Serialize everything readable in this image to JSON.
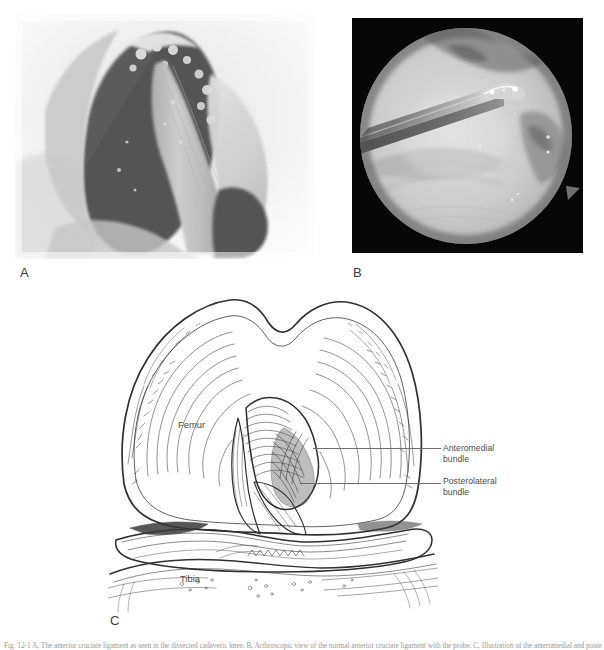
{
  "figure": {
    "background_color": "#ffffff",
    "caption_text": "Fig. 12-1  A, The anterior cruciate ligament as seen in the dissected cadaveric knee. B, Arthroscopic view of the normal anterior cruciate ligament with the probe. C, Illustration of the anteromedial and posterolateral bundles.",
    "panels": [
      {
        "id": "A",
        "letter": "A",
        "name": "cadaveric-dissection-photo",
        "type": "grayscale-photograph",
        "description": "Dissected knee specimen showing the intercondylar notch and anterior cruciate ligament",
        "background_color": "#f7f7f7"
      },
      {
        "id": "B",
        "letter": "B",
        "name": "arthroscopic-photo",
        "type": "arthroscopic-photograph",
        "description": "Arthroscopic view of the normal anterior cruciate ligament with an arthroscopic probe entering from the upper left",
        "background_color": "#070707",
        "vignette_shape": "circle"
      },
      {
        "id": "C",
        "letter": "C",
        "name": "knee-line-illustration",
        "type": "line-art-illustration",
        "description": "Anterior view line drawing of the knee joint showing the femur, tibia, menisci and the two bundles of the anterior cruciate ligament",
        "background_color": "#ffffff"
      }
    ],
    "anatomy_labels": [
      {
        "key": "femur",
        "text": "Femur",
        "x": 178,
        "y": 424
      },
      {
        "key": "tibia",
        "text": "Tibia",
        "x": 180,
        "y": 578
      }
    ],
    "callouts": [
      {
        "key": "anteromedial",
        "text": "Anteromedial\nbundle",
        "leader_from_x": 313,
        "leader_to_x": 441,
        "leader_y": 448
      },
      {
        "key": "posterolateral",
        "text": "Posterolateral\nbundle",
        "leader_from_x": 300,
        "leader_to_x": 441,
        "leader_y": 483
      }
    ],
    "colors": {
      "ink": "#3a3a3a",
      "label_text": "#4a4a4a",
      "leader_line": "#6e6e6e",
      "caption_text": "#9a9a9a",
      "panel_b_backdrop": "#070707"
    }
  }
}
